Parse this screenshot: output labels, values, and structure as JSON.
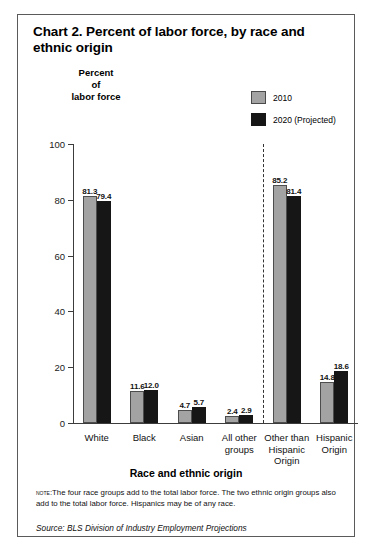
{
  "figure": {
    "title": "Chart 2. Percent of labor force, by race and ethnic origin",
    "y_caption_line1": "Percent",
    "y_caption_line2": "of",
    "y_caption_line3": "labor force",
    "x_axis_title": "Race and ethnic origin",
    "note_lead": "Note:",
    "note_text": "The four race groups add to the total labor force.  The two ethnic origin groups also add to the total labor force.  Hispanics may be of any race.",
    "source": "Source: BLS Division of Industry Employment Projections",
    "colors": {
      "series_2010": "#a3a3a3",
      "series_2020": "#161616",
      "axis": "#3c3c3c",
      "border": "#5a5a5a",
      "divider": "#333333"
    }
  },
  "legend": {
    "items": [
      {
        "label": "2010",
        "color": "#a3a3a3"
      },
      {
        "label": "2020 (Projected)",
        "color": "#161616"
      }
    ]
  },
  "chart_data": {
    "type": "bar",
    "title": "Chart 2. Percent of labor force, by race and ethnic origin",
    "xlabel": "Race and ethnic origin",
    "ylabel": "Percent of labor force",
    "ylim": [
      0,
      100
    ],
    "yticks": [
      0,
      20,
      40,
      60,
      80,
      100
    ],
    "ytick_labels": [
      "0",
      "20",
      "40",
      "60",
      "80",
      "100"
    ],
    "grid": false,
    "legend_position": "top-right",
    "categories": [
      "White",
      "Black",
      "Asian",
      "All other groups",
      "Other than Hispanic Origin",
      "Hispanic Origin"
    ],
    "category_label_lines": [
      [
        "White"
      ],
      [
        "Black"
      ],
      [
        "Asian"
      ],
      [
        "All other",
        "groups"
      ],
      [
        "Other than",
        "Hispanic",
        "Origin"
      ],
      [
        "Hispanic",
        "Origin"
      ]
    ],
    "series": [
      {
        "name": "2010",
        "color": "#a3a3a3",
        "values": [
          81.3,
          11.6,
          4.7,
          2.4,
          85.2,
          14.8
        ]
      },
      {
        "name": "2020 (Projected)",
        "color": "#161616",
        "values": [
          79.4,
          12.0,
          5.7,
          2.9,
          81.4,
          18.6
        ]
      }
    ],
    "annotations": {
      "divider_after_category_index": 3,
      "divider_style": "dashed-vertical",
      "divider_meaning": "separates race groups from ethnic origin groups"
    }
  }
}
